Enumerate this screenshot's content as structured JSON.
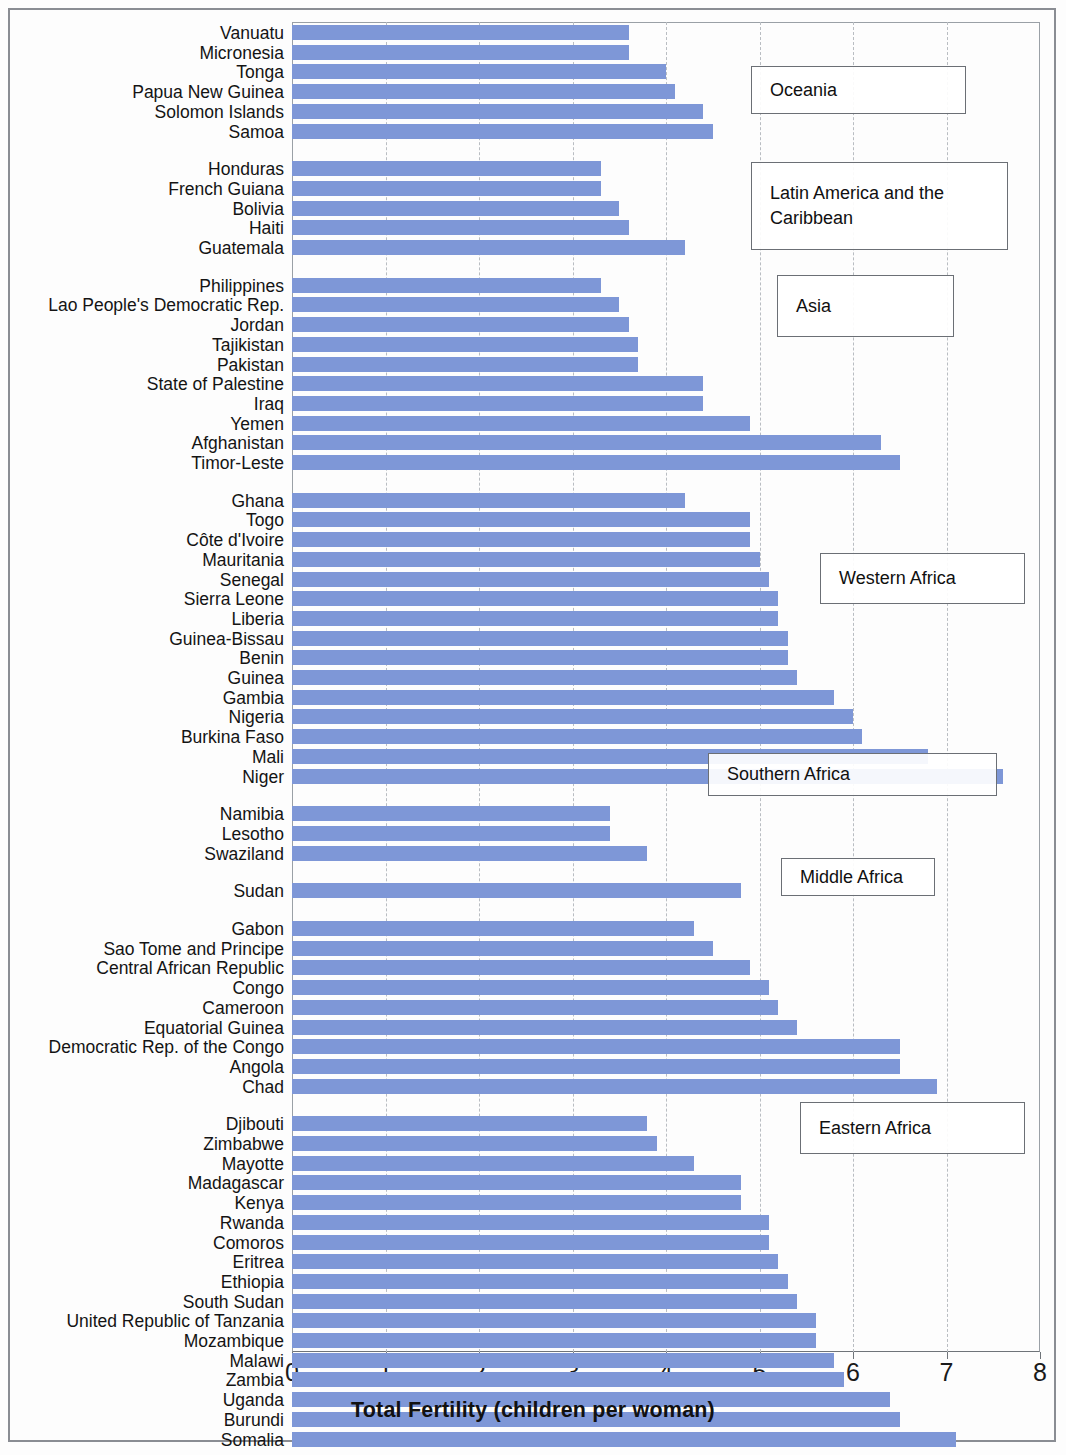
{
  "chart_data": {
    "type": "bar",
    "orientation": "horizontal",
    "title": "",
    "xlabel": "Total Fertility  (children per woman)",
    "ylabel": "",
    "xlim": [
      0,
      8
    ],
    "xticks": [
      "0",
      "1",
      "2",
      "3",
      "4",
      "5",
      "6",
      "7",
      "8"
    ],
    "grid": true,
    "legend": "none",
    "bar_color": "#7e97d7",
    "categories": [
      "Vanuatu",
      "Micronesia",
      "Tonga",
      "Papua New Guinea",
      "Solomon Islands",
      "Samoa",
      "Honduras",
      "French Guiana",
      "Bolivia",
      "Haiti",
      "Guatemala",
      "Philippines",
      "Lao People's Democratic Rep.",
      "Jordan",
      "Tajikistan",
      "Pakistan",
      "State of Palestine",
      "Iraq",
      "Yemen",
      "Afghanistan",
      "Timor-Leste",
      "Ghana",
      "Togo",
      "Côte d'Ivoire",
      "Mauritania",
      "Senegal",
      "Sierra Leone",
      "Liberia",
      "Guinea-Bissau",
      "Benin",
      "Guinea",
      "Gambia",
      "Nigeria",
      "Burkina Faso",
      "Mali",
      "Niger",
      "Namibia",
      "Lesotho",
      "Swaziland",
      "Sudan",
      "Gabon",
      "Sao Tome and Principe",
      "Central African Republic",
      "Congo",
      "Cameroon",
      "Equatorial Guinea",
      "Democratic Rep. of the Congo",
      "Angola",
      "Chad",
      "Djibouti",
      "Zimbabwe",
      "Mayotte",
      "Madagascar",
      "Kenya",
      "Rwanda",
      "Comoros",
      "Eritrea",
      "Ethiopia",
      "South Sudan",
      "United Republic of Tanzania",
      "Mozambique",
      "Malawi",
      "Zambia",
      "Uganda",
      "Burundi",
      "Somalia"
    ],
    "values": [
      3.6,
      3.6,
      4.0,
      4.1,
      4.4,
      4.5,
      3.3,
      3.3,
      3.5,
      3.6,
      4.2,
      3.3,
      3.5,
      3.6,
      3.7,
      3.7,
      4.4,
      4.4,
      4.9,
      6.3,
      6.5,
      4.2,
      4.9,
      4.9,
      5.0,
      5.1,
      5.2,
      5.2,
      5.3,
      5.3,
      5.4,
      5.8,
      6.0,
      6.1,
      6.8,
      7.6,
      3.4,
      3.4,
      3.8,
      4.8,
      4.3,
      4.5,
      4.9,
      5.1,
      5.2,
      5.4,
      6.5,
      6.5,
      6.9,
      3.8,
      3.9,
      4.3,
      4.8,
      4.8,
      5.1,
      5.1,
      5.2,
      5.3,
      5.4,
      5.6,
      5.6,
      5.8,
      5.9,
      6.4,
      6.5,
      7.1
    ],
    "groups": [
      {
        "label": "Oceania",
        "count": 6
      },
      {
        "label": "Latin America and the Caribbean",
        "count": 5
      },
      {
        "label": "Asia",
        "count": 10
      },
      {
        "label": "Western Africa",
        "count": 15
      },
      {
        "label": "Southern Africa",
        "count": 3
      },
      {
        "label": "Sudan",
        "count": 1,
        "no_callout": true
      },
      {
        "label": "Middle Africa",
        "count": 9
      },
      {
        "label": "Eastern Africa",
        "count": 17
      }
    ],
    "annotations": [
      {
        "label": "Oceania",
        "left": 751,
        "top": 66,
        "width": 215,
        "height": 48
      },
      {
        "label": "Latin America and the Caribbean",
        "left": 751,
        "top": 162,
        "width": 257,
        "height": 88,
        "wrap": 1
      },
      {
        "label": "Asia",
        "left": 777,
        "top": 275,
        "width": 177,
        "height": 62
      },
      {
        "label": "Western Africa",
        "left": 820,
        "top": 553,
        "width": 205,
        "height": 51
      },
      {
        "label": "Southern Africa",
        "left": 708,
        "top": 753,
        "width": 289,
        "height": 43
      },
      {
        "label": "Middle Africa",
        "left": 781,
        "top": 858,
        "width": 154,
        "height": 38
      },
      {
        "label": "Eastern Africa",
        "left": 800,
        "top": 1102,
        "width": 225,
        "height": 52
      }
    ]
  }
}
